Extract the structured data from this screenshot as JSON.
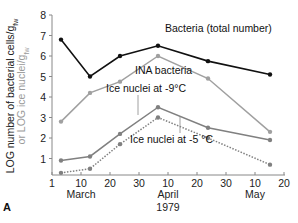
{
  "chart_data": {
    "type": "line",
    "panel_label": "A",
    "title": "",
    "xlabel": "1979",
    "ylabel": "LOG number of bacterial cells/g_fw or LOG ice nuclei/g_fw",
    "ylabel_line1": "LOG  number of bacterial cells/g",
    "ylabel_line1_sub": "fw",
    "ylabel_line2": "or LOG ice nuclei/g",
    "ylabel_line2_sub": "fw",
    "ylim": [
      0,
      8
    ],
    "yticks": [
      "1",
      "2",
      "3",
      "4",
      "5",
      "6",
      "7",
      "8"
    ],
    "xticks": [
      "1",
      "10",
      "20",
      "30",
      "10",
      "20",
      "30",
      "10",
      "20"
    ],
    "month_labels": [
      "March",
      "April",
      "May"
    ],
    "year_label": "1979",
    "grid": false,
    "x": [
      "Mar 4",
      "Mar 14",
      "Mar 24",
      "Apr 7",
      "Apr 24",
      "May 16"
    ],
    "series": [
      {
        "name": "Bacteria (total number)",
        "color": "#111111",
        "style": "solid",
        "values": [
          6.8,
          5.0,
          6.0,
          6.5,
          5.75,
          5.1
        ]
      },
      {
        "name": "INA bacteria",
        "color": "#a0a0a0",
        "style": "solid",
        "values": [
          2.8,
          4.2,
          4.75,
          6.0,
          4.9,
          2.3
        ]
      },
      {
        "name": "Ice nuclei at -9°C",
        "color": "#808080",
        "style": "solid",
        "values": [
          0.9,
          1.1,
          2.2,
          3.5,
          2.5,
          1.9
        ]
      },
      {
        "name": "Ice nuclei at -5 °C",
        "color": "#808080",
        "style": "dotted",
        "values": [
          0.3,
          0.5,
          1.7,
          3.0,
          2.0,
          0.7
        ]
      }
    ]
  }
}
